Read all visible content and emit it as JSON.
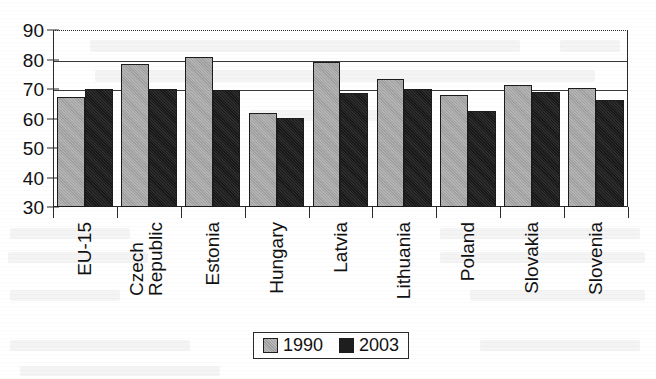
{
  "chart_data": {
    "type": "bar",
    "title": "",
    "subtitle": "",
    "xlabel": "",
    "ylabel": "",
    "ylim": [
      30,
      90
    ],
    "yticks": [
      30,
      40,
      50,
      60,
      70,
      80,
      90
    ],
    "grid": true,
    "legend_position": "bottom",
    "categories": [
      "EU-15",
      "Czech Republic",
      "Estonia",
      "Hungary",
      "Latvia",
      "Lithuania",
      "Poland",
      "Slovakia",
      "Slovenia"
    ],
    "series": [
      {
        "name": "1990",
        "color": "#a9a9a9",
        "values": [
          67.3,
          78.5,
          81.0,
          61.8,
          79.2,
          73.3,
          67.9,
          71.5,
          70.4
        ]
      },
      {
        "name": "2003",
        "color": "#1e1e1e",
        "values": [
          70.0,
          70.0,
          69.8,
          60.3,
          68.8,
          70.0,
          62.7,
          69.0,
          66.2
        ]
      }
    ]
  },
  "legend": {
    "items": [
      {
        "label": "1990",
        "swatch": "gray-square-icon"
      },
      {
        "label": "2003",
        "swatch": "black-square-icon"
      }
    ]
  },
  "axis": {
    "y_labels": [
      "90",
      "80",
      "70",
      "60",
      "50",
      "40",
      "30"
    ],
    "x_labels": [
      {
        "line1": "EU-15",
        "line2": ""
      },
      {
        "line1": "Czech",
        "line2": "Republic"
      },
      {
        "line1": "Estonia",
        "line2": ""
      },
      {
        "line1": "Hungary",
        "line2": ""
      },
      {
        "line1": "Latvia",
        "line2": ""
      },
      {
        "line1": "Lithuania",
        "line2": ""
      },
      {
        "line1": "Poland",
        "line2": ""
      },
      {
        "line1": "Slovakia",
        "line2": ""
      },
      {
        "line1": "Slovenia",
        "line2": ""
      }
    ]
  }
}
